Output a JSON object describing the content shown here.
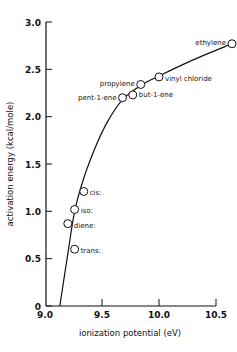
{
  "chart_data": {
    "type": "scatter",
    "title": "",
    "xlabel": "ionization potential (eV)",
    "ylabel": "activation energy (kcal/mole)",
    "xlim": [
      9.0,
      10.5
    ],
    "ylim": [
      0,
      3.0
    ],
    "x_ticks": [
      9.0,
      9.5,
      10.0,
      10.5
    ],
    "x_tick_labels": [
      "9.0",
      "9.5",
      "10.0",
      "10.5"
    ],
    "y_ticks": [
      0,
      0.5,
      1.0,
      1.5,
      2.0,
      2.5,
      3.0
    ],
    "y_tick_labels": [
      "0",
      "0.5",
      "1.0",
      "1.5",
      "2.0",
      "2.5",
      "3.0"
    ],
    "grid": false,
    "legend": null,
    "points": [
      {
        "label": "ethylene",
        "x": 10.64,
        "y": 2.77
      },
      {
        "label": "vinyl chloride",
        "x": 10.0,
        "y": 2.42
      },
      {
        "label": "propylene",
        "x": 9.84,
        "y": 2.34
      },
      {
        "label": "but-1-ene",
        "x": 9.77,
        "y": 2.23
      },
      {
        "label": "pent-1-ene",
        "x": 9.68,
        "y": 2.2
      },
      {
        "label": "cis:",
        "x": 9.34,
        "y": 1.21
      },
      {
        "label": "iso:",
        "x": 9.26,
        "y": 1.02
      },
      {
        "label": "diene:",
        "x": 9.2,
        "y": 0.87
      },
      {
        "label": "trans:",
        "x": 9.26,
        "y": 0.6
      }
    ],
    "curve": {
      "description": "smooth fitted curve through points",
      "x": [
        9.13,
        9.2,
        9.26,
        9.34,
        9.45,
        9.55,
        9.68,
        9.84,
        10.0,
        10.3,
        10.64
      ],
      "y": [
        0.0,
        0.55,
        1.0,
        1.35,
        1.7,
        1.95,
        2.18,
        2.33,
        2.43,
        2.6,
        2.77
      ]
    }
  },
  "labels": {
    "xlabel": "ionization potential (eV)",
    "ylabel": "activation energy (kcal/mole)"
  }
}
